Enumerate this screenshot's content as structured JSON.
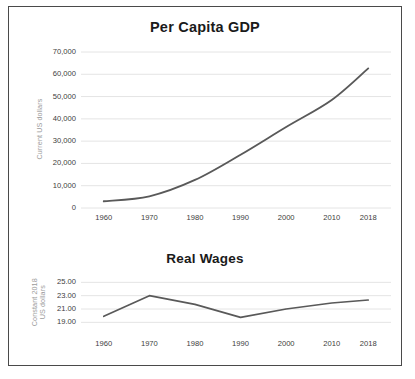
{
  "figure": {
    "background": "#ffffff",
    "border_color": "#4a4a4a",
    "line_color": "#595959",
    "gridline_color": "#e4e4e4",
    "tick_label_color": "#3d3d3d",
    "axis_title_color": "#9b9b9b"
  },
  "chart_data": [
    {
      "type": "line",
      "title": "Per Capita GDP",
      "xlabel": "",
      "ylabel": "Current US dollars",
      "categories": [
        "1960",
        "1970",
        "1980",
        "1990",
        "2000",
        "2010",
        "2018"
      ],
      "x": [
        1960,
        1970,
        1980,
        1990,
        2000,
        2010,
        2018
      ],
      "values": [
        3007,
        5234,
        12575,
        23889,
        36330,
        48467,
        62641
      ],
      "ytick_labels": [
        "0",
        "10,000",
        "20,000",
        "30,000",
        "40,000",
        "50,000",
        "60,000",
        "70,000"
      ],
      "ytick_values": [
        0,
        10000,
        20000,
        30000,
        40000,
        50000,
        60000,
        70000
      ],
      "ylim": [
        0,
        70000
      ],
      "xlim": [
        1955,
        2023
      ],
      "grid": true,
      "legend": "none",
      "series": [
        {
          "name": "Per Capita GDP",
          "values": [
            3007,
            5234,
            12575,
            23889,
            36330,
            48467,
            62641
          ]
        }
      ]
    },
    {
      "type": "line",
      "title": "Real Wages",
      "xlabel": "",
      "ylabel": "Constant 2018 US dollars",
      "ylabel_line1": "Constant 2018",
      "ylabel_line2": "US dollars",
      "categories": [
        "1960",
        "1970",
        "1980",
        "1990",
        "2000",
        "2010",
        "2018"
      ],
      "x": [
        1960,
        1970,
        1980,
        1990,
        2000,
        2010,
        2018
      ],
      "values": [
        19.9,
        23.0,
        21.7,
        19.75,
        21.0,
        21.9,
        22.35
      ],
      "ytick_labels": [
        "19.00",
        "21.00",
        "23.00",
        "25.00"
      ],
      "ytick_values": [
        19.0,
        21.0,
        23.0,
        25.0
      ],
      "ylim": [
        18.0,
        25.8
      ],
      "xlim": [
        1955,
        2023
      ],
      "grid": true,
      "legend": "none",
      "series": [
        {
          "name": "Real Wages",
          "values": [
            19.9,
            23.0,
            21.7,
            19.75,
            21.0,
            21.9,
            22.35
          ]
        }
      ]
    }
  ]
}
